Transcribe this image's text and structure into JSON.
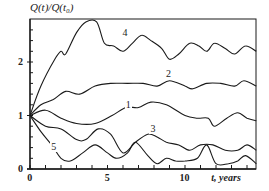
{
  "chart_data": {
    "type": "line",
    "title": "",
    "ylabel": "Q(t)/Q(t₀)",
    "xlabel": "t, years",
    "xlim": [
      0,
      14.6
    ],
    "ylim": [
      0,
      2.8
    ],
    "grid": false,
    "legend": "inline numeric labels on curves",
    "x_ticks": [
      0,
      1,
      2,
      3,
      4,
      5,
      6,
      7,
      8,
      9,
      10,
      11,
      12,
      13,
      14
    ],
    "x_tick_labels": [
      {
        "value": 0,
        "label": "0"
      },
      {
        "value": 5,
        "label": "5"
      },
      {
        "value": 10,
        "label": "10"
      }
    ],
    "y_ticks": [
      0,
      0.2,
      0.4,
      0.6,
      0.8,
      1.0,
      1.2,
      1.4,
      1.6,
      1.8,
      2.0,
      2.2,
      2.4,
      2.6
    ],
    "y_tick_labels": [
      {
        "value": 0,
        "label": "0"
      },
      {
        "value": 1,
        "label": "1"
      },
      {
        "value": 2,
        "label": "2"
      }
    ],
    "series": [
      {
        "name": "1",
        "label_pos": {
          "t": 6.3,
          "v": 1.2
        },
        "t": [
          0,
          1.0,
          2.0,
          3.0,
          4.2,
          5.3,
          6.2,
          7.0,
          7.8,
          8.8,
          10.0,
          10.8,
          11.5,
          11.9,
          12.7,
          13.4,
          14.0,
          14.6
        ],
        "values": [
          1.0,
          1.1,
          0.95,
          0.85,
          0.85,
          1.0,
          1.15,
          1.15,
          1.25,
          1.2,
          1.0,
          0.95,
          0.95,
          0.8,
          0.95,
          1.05,
          0.95,
          0.9
        ]
      },
      {
        "name": "2",
        "label_pos": {
          "t": 8.9,
          "v": 1.78
        },
        "t": [
          0,
          0.7,
          1.5,
          2.3,
          3.2,
          4.2,
          5.2,
          6.3,
          7.3,
          8.2,
          9.0,
          10.0,
          10.5,
          11.4,
          12.3,
          13.2,
          13.8,
          14.6
        ],
        "values": [
          1.0,
          1.2,
          1.3,
          1.45,
          1.4,
          1.55,
          1.6,
          1.6,
          1.6,
          1.55,
          1.65,
          1.55,
          1.5,
          1.6,
          1.6,
          1.55,
          1.65,
          1.55
        ]
      },
      {
        "name": "3",
        "label_pos": {
          "t": 7.9,
          "v": 0.75
        },
        "t": [
          0,
          1.0,
          2.0,
          3.0,
          3.6,
          4.4,
          5.2,
          6.0,
          6.8,
          7.6,
          8.2,
          8.8,
          9.6,
          10.3,
          11.0,
          11.8,
          12.6,
          13.4,
          14.0,
          14.6
        ],
        "values": [
          1.0,
          0.8,
          0.75,
          0.55,
          0.55,
          0.75,
          0.65,
          0.3,
          0.5,
          0.65,
          0.6,
          0.5,
          0.45,
          0.35,
          0.45,
          0.45,
          0.35,
          0.35,
          0.45,
          0.35
        ]
      },
      {
        "name": "4",
        "label_pos": {
          "t": 6.1,
          "v": 2.55
        },
        "t": [
          0,
          0.7,
          1.6,
          2.0,
          2.3,
          3.0,
          3.6,
          4.3,
          4.8,
          5.4,
          6.0,
          6.6,
          7.2,
          7.8,
          8.5,
          9.0,
          9.6,
          10.3,
          10.9,
          11.4,
          11.9,
          12.6,
          13.2,
          13.9,
          14.6
        ],
        "values": [
          1.0,
          1.55,
          2.05,
          2.2,
          2.15,
          2.55,
          2.75,
          2.75,
          2.35,
          2.3,
          2.2,
          2.35,
          2.5,
          2.4,
          2.25,
          2.05,
          2.15,
          2.35,
          2.3,
          2.2,
          2.35,
          2.25,
          2.15,
          2.3,
          2.2
        ]
      },
      {
        "name": "5",
        "label_pos": {
          "t": 1.5,
          "v": 0.42
        },
        "t": [
          0,
          0.7,
          1.4,
          2.0,
          2.6,
          3.4,
          4.2,
          5.0,
          5.6,
          6.3,
          6.8,
          7.6,
          8.2,
          8.8,
          9.4,
          10.0,
          10.8,
          11.4,
          12.0,
          12.8,
          13.4,
          13.9,
          14.6
        ],
        "values": [
          1.0,
          0.7,
          0.45,
          0.2,
          0.15,
          0.3,
          0.45,
          0.3,
          0.2,
          0.3,
          0.5,
          0.25,
          0.1,
          0.2,
          0.15,
          0.15,
          0.2,
          0.45,
          0.1,
          0.1,
          0.15,
          0.25,
          0.1
        ]
      }
    ]
  },
  "style": {
    "line_color": "#1a1a1a",
    "axis_color": "#1a1a1a",
    "background": "#ffffff"
  },
  "layout": {
    "plot_left": 30,
    "plot_top": 19,
    "plot_right": 256,
    "plot_bottom": 169,
    "px_per_year": 15.5,
    "px_per_unit": 53.5
  }
}
